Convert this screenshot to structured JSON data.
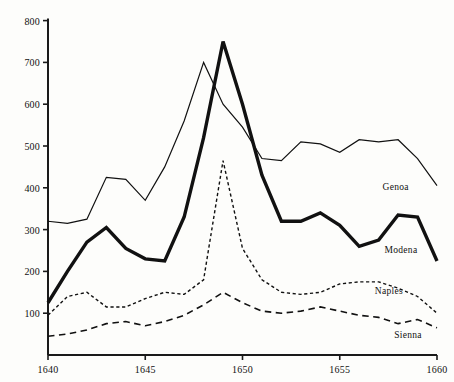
{
  "chart_data": {
    "type": "line",
    "title": "",
    "subtitle": "",
    "xlabel": "",
    "ylabel": "",
    "xlim": [
      1640,
      1660
    ],
    "ylim": [
      0,
      800
    ],
    "grid": false,
    "legend_position": "inline-right",
    "x_ticks": [
      "1640",
      "1645",
      "1650",
      "1655",
      "1660"
    ],
    "x_tick_values": [
      1640,
      1645,
      1650,
      1655,
      1660
    ],
    "y_ticks": [
      "100",
      "200",
      "300",
      "400",
      "500",
      "600",
      "700",
      "800"
    ],
    "y_tick_values": [
      100,
      200,
      300,
      400,
      500,
      600,
      700,
      800
    ],
    "x": [
      1640,
      1641,
      1642,
      1643,
      1644,
      1645,
      1646,
      1647,
      1648,
      1649,
      1650,
      1651,
      1652,
      1653,
      1654,
      1655,
      1656,
      1657,
      1658,
      1659,
      1660
    ],
    "series": [
      {
        "name": "Genoa",
        "style": "solid-thin",
        "line_width": 1.2,
        "color": "#111111",
        "label_x": 1657.2,
        "label_y": 400,
        "values": [
          320,
          315,
          325,
          425,
          420,
          370,
          450,
          560,
          700,
          600,
          545,
          470,
          465,
          510,
          505,
          485,
          515,
          510,
          515,
          470,
          405
        ]
      },
      {
        "name": "Modena",
        "style": "solid-thick",
        "line_width": 3.4,
        "color": "#111111",
        "label_x": 1657.3,
        "label_y": 250,
        "values": [
          125,
          200,
          270,
          305,
          255,
          230,
          225,
          330,
          520,
          750,
          600,
          430,
          320,
          320,
          340,
          310,
          260,
          275,
          335,
          330,
          225
        ]
      },
      {
        "name": "Naples",
        "style": "dotted",
        "line_width": 1.4,
        "color": "#111111",
        "label_x": 1656.8,
        "label_y": 150,
        "values": [
          95,
          140,
          150,
          115,
          115,
          135,
          150,
          145,
          180,
          465,
          255,
          180,
          150,
          145,
          150,
          170,
          175,
          175,
          160,
          140,
          100
        ]
      },
      {
        "name": "Sienna",
        "style": "dashed",
        "line_width": 1.6,
        "color": "#111111",
        "label_x": 1657.8,
        "label_y": 45,
        "values": [
          45,
          50,
          60,
          75,
          80,
          70,
          80,
          95,
          120,
          150,
          125,
          105,
          100,
          105,
          115,
          105,
          95,
          90,
          75,
          85,
          65
        ]
      }
    ]
  },
  "axes": {
    "axis_color": "#1a1a1a",
    "tick_length": 5
  }
}
